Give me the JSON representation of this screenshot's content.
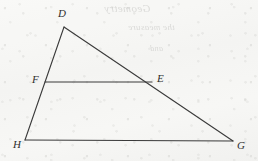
{
  "figure": {
    "background_color": "#f6f6f4",
    "stroke_color": "#3a3a3a",
    "label_color": "#2e2e2e",
    "width": 258,
    "height": 161
  },
  "vertices": [
    {
      "id": "D",
      "label": "D",
      "x": 64,
      "y": 27,
      "label_x": 58,
      "label_y": 8,
      "role": "apex"
    },
    {
      "id": "F",
      "label": "F",
      "x": 45,
      "y": 82,
      "label_x": 32,
      "label_y": 74,
      "role": "point-on-DH"
    },
    {
      "id": "E",
      "label": "E",
      "x": 152,
      "y": 82,
      "label_x": 157,
      "label_y": 73,
      "role": "point-on-DG"
    },
    {
      "id": "H",
      "label": "H",
      "x": 25,
      "y": 140,
      "label_x": 13,
      "label_y": 139,
      "role": "base-left"
    },
    {
      "id": "G",
      "label": "G",
      "x": 233,
      "y": 141,
      "label_x": 237,
      "label_y": 140,
      "role": "base-right"
    }
  ],
  "segments": [
    {
      "id": "DG",
      "from": "D",
      "to": "G",
      "x1": 64,
      "y1": 27,
      "x2": 233,
      "y2": 141,
      "stroke_width": 1.1
    },
    {
      "id": "DH",
      "from": "D",
      "to": "H",
      "x1": 64,
      "y1": 27,
      "x2": 25,
      "y2": 140,
      "stroke_width": 1.1
    },
    {
      "id": "HG",
      "from": "H",
      "to": "G",
      "x1": 25,
      "y1": 140,
      "x2": 233,
      "y2": 141,
      "stroke_width": 1.1
    },
    {
      "id": "FE",
      "from": "F",
      "to": "E",
      "x1": 45,
      "y1": 82,
      "x2": 152,
      "y2": 82,
      "stroke_width": 1.1
    }
  ],
  "ghost_text": {
    "line_1": "Geometry",
    "line_2": "the measure",
    "line_3": "and"
  }
}
